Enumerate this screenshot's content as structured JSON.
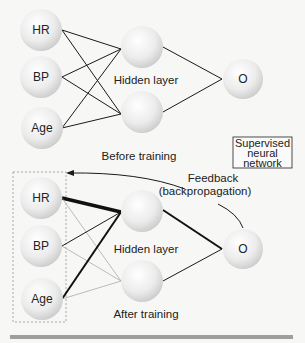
{
  "diagram": {
    "title_box": [
      "Supervised",
      "neural",
      "network"
    ],
    "before": {
      "inputs": [
        "HR",
        "BP",
        "Age"
      ],
      "hidden_label": "Hidden layer",
      "output": "O",
      "caption": "Before training"
    },
    "after": {
      "inputs": [
        "HR",
        "BP",
        "Age"
      ],
      "hidden_label": "Hidden layer",
      "output": "O",
      "caption": "After training",
      "feedback_label": [
        "Feedback",
        "(backpropagation)"
      ]
    },
    "colors": {
      "node_fill": "#e6e6e6",
      "edge": "#1a1a1a",
      "faint_edge": "#9a9a9a",
      "bar": "#9e9e9e"
    }
  }
}
